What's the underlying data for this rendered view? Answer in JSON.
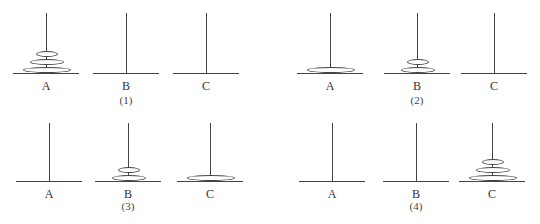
{
  "figure": {
    "caption_visible_text": "",
    "panels": [
      {
        "number": "(1)",
        "pegs": [
          {
            "label": "A",
            "x": 46,
            "disks": [
              3,
              2,
              1
            ]
          },
          {
            "label": "B",
            "x": 126,
            "disks": []
          },
          {
            "label": "C",
            "x": 206,
            "disks": []
          }
        ]
      },
      {
        "number": "(2)",
        "pegs": [
          {
            "label": "A",
            "x": 330,
            "disks": [
              3
            ]
          },
          {
            "label": "B",
            "x": 417,
            "disks": [
              2,
              1
            ]
          },
          {
            "label": "C",
            "x": 494,
            "disks": []
          }
        ]
      },
      {
        "number": "(3)",
        "pegs": [
          {
            "label": "A",
            "x": 49,
            "disks": []
          },
          {
            "label": "B",
            "x": 128,
            "disks": [
              2,
              1
            ]
          },
          {
            "label": "C",
            "x": 210,
            "disks": [
              3
            ]
          }
        ]
      },
      {
        "number": "(4)",
        "pegs": [
          {
            "label": "A",
            "x": 332,
            "disks": []
          },
          {
            "label": "B",
            "x": 416,
            "disks": []
          },
          {
            "label": "C",
            "x": 492,
            "disks": [
              3,
              2,
              1
            ]
          }
        ]
      }
    ]
  }
}
